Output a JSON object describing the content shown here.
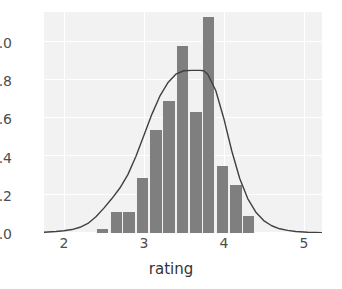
{
  "chart_data": {
    "type": "bar",
    "title": "",
    "subtitle": "",
    "xlabel": "rating",
    "ylabel": "",
    "xlim": [
      1.85,
      5.33
    ],
    "ylim": [
      0.0,
      1.155
    ],
    "grid": true,
    "legend": null,
    "xticks": [
      "2",
      "3",
      "4",
      "5"
    ],
    "xtick_values": [
      2,
      3,
      4,
      5
    ],
    "yticks": [
      "0.0",
      "0.2",
      "0.4",
      "0.6",
      "0.8",
      "1.0"
    ],
    "ytick_values": [
      0.0,
      0.2,
      0.4,
      0.6,
      0.8,
      1.0
    ],
    "bin_width": 0.1667,
    "bar_color": "#7f7f7f",
    "panel_color": "#f2f2f2",
    "grid_color": "#ffffff",
    "curve_color": "#404040",
    "categories": [
      "2.50-2.67",
      "2.67-2.83",
      "2.83-3.00",
      "3.00-3.17",
      "3.17-3.33",
      "3.33-3.50",
      "3.50-3.67",
      "3.67-3.83",
      "3.83-4.00",
      "4.00-4.17",
      "4.17-4.33",
      "4.33-4.50"
    ],
    "bin_left_edges": [
      2.5,
      2.67,
      2.83,
      3.0,
      3.17,
      3.33,
      3.5,
      3.67,
      3.83,
      4.0,
      4.17,
      4.33
    ],
    "values": [
      0.02,
      0.11,
      0.11,
      0.29,
      0.54,
      0.69,
      0.98,
      0.63,
      1.13,
      0.35,
      0.25,
      0.09
    ],
    "series": [
      {
        "name": "histogram density",
        "values": [
          0.02,
          0.11,
          0.11,
          0.29,
          0.54,
          0.69,
          0.98,
          0.63,
          1.13,
          0.35,
          0.25,
          0.09
        ]
      },
      {
        "name": "kernel density estimate",
        "type": "line",
        "x": [
          1.85,
          2.0,
          2.1,
          2.2,
          2.3,
          2.4,
          2.5,
          2.6,
          2.7,
          2.8,
          2.9,
          3.0,
          3.1,
          3.2,
          3.3,
          3.4,
          3.5,
          3.6,
          3.7,
          3.8,
          3.85,
          3.9,
          4.0,
          4.1,
          4.2,
          4.3,
          4.4,
          4.5,
          4.6,
          4.7,
          4.8,
          4.9,
          5.0,
          5.15,
          5.33
        ],
        "values": [
          0.004,
          0.008,
          0.012,
          0.018,
          0.03,
          0.05,
          0.085,
          0.13,
          0.18,
          0.235,
          0.305,
          0.4,
          0.51,
          0.62,
          0.715,
          0.785,
          0.83,
          0.848,
          0.85,
          0.85,
          0.848,
          0.83,
          0.745,
          0.6,
          0.43,
          0.285,
          0.18,
          0.11,
          0.065,
          0.038,
          0.022,
          0.014,
          0.008,
          0.004,
          0.002
        ]
      }
    ]
  }
}
